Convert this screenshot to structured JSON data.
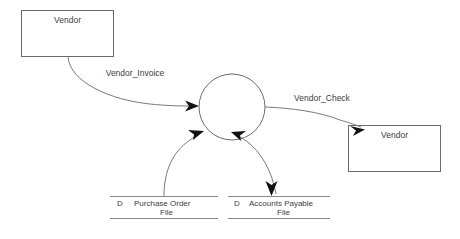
{
  "diagram": {
    "type": "data-flow-diagram",
    "background_color": "#ffffff",
    "line_color": "#7a7a7a",
    "text_color": "#3d3d3d",
    "arrow_color": "#111111",
    "external_entities": [
      {
        "id": "vendor-source",
        "label": "Vendor",
        "position": "top-left"
      },
      {
        "id": "vendor-sink",
        "label": "Vendor",
        "position": "right"
      }
    ],
    "process": {
      "id": "process-circle",
      "label": ""
    },
    "data_stores": [
      {
        "id": "purchase-order-file",
        "tag": "D",
        "label_line1": "Purchase Order",
        "label_line2": "File"
      },
      {
        "id": "accounts-payable-file",
        "tag": "D",
        "label_line1": "Accounts Payable",
        "label_line2": "File"
      }
    ],
    "data_flows": [
      {
        "id": "vendor-invoice-flow",
        "label": "Vendor_Invoice",
        "from": "vendor-source",
        "to": "process-circle"
      },
      {
        "id": "vendor-check-flow",
        "label": "Vendor_Check",
        "from": "process-circle",
        "to": "vendor-sink"
      },
      {
        "id": "purchase-order-flow",
        "label": "",
        "from": "purchase-order-file",
        "to": "process-circle"
      },
      {
        "id": "accounts-payable-in-flow",
        "label": "",
        "from": "accounts-payable-file",
        "to": "process-circle"
      },
      {
        "id": "accounts-payable-out-flow",
        "label": "",
        "from": "process-circle",
        "to": "accounts-payable-file"
      }
    ]
  }
}
